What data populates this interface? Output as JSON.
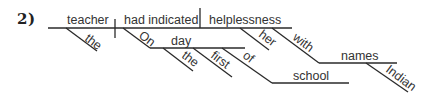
{
  "problem_number": "2)",
  "colors": {
    "line": "#2a2a2a",
    "text": "#333333",
    "background": "#ffffff"
  },
  "diagram": {
    "type": "sentence-diagram",
    "main_line": {
      "x1": 48,
      "y1": 28,
      "x2": 292,
      "y2": 28
    },
    "subject_divider": {
      "x1": 115,
      "y1": 19,
      "x2": 115,
      "y2": 38
    },
    "object_divider": {
      "x1": 200,
      "y1": 8,
      "x2": 200,
      "y2": 28
    },
    "words": {
      "subject": {
        "text": "teacher",
        "x": 67,
        "y": 24
      },
      "verb": {
        "text": "had indicated",
        "x": 124,
        "y": 24
      },
      "object": {
        "text": "helplessness",
        "x": 209,
        "y": 24
      },
      "the_1": {
        "text": "the",
        "x": 84,
        "y": 40,
        "angle": 37
      },
      "on": {
        "text": "On",
        "x": 138,
        "y": 37,
        "angle": 37
      },
      "day": {
        "text": "day",
        "x": 171,
        "y": 45
      },
      "the_2": {
        "text": "the",
        "x": 181,
        "y": 57,
        "angle": 37
      },
      "first": {
        "text": "first",
        "x": 210,
        "y": 57,
        "angle": 37
      },
      "of": {
        "text": "of",
        "x": 242,
        "y": 57,
        "angle": 37
      },
      "school": {
        "text": "school",
        "x": 293,
        "y": 80
      },
      "her": {
        "text": "her",
        "x": 258,
        "y": 36,
        "angle": 37
      },
      "with": {
        "text": "with",
        "x": 292,
        "y": 39,
        "angle": 37
      },
      "names": {
        "text": "names",
        "x": 341,
        "y": 60
      },
      "indian": {
        "text": "Indian",
        "x": 385,
        "y": 71,
        "angle": 37
      }
    },
    "segments": {
      "the_1_slant": {
        "x1": 66,
        "y1": 28,
        "x2": 97,
        "y2": 51
      },
      "on_slant": {
        "x1": 123,
        "y1": 28,
        "x2": 150,
        "y2": 48
      },
      "day_line": {
        "x1": 150,
        "y1": 48,
        "x2": 245,
        "y2": 48
      },
      "the_2_slant": {
        "x1": 163,
        "y1": 48,
        "x2": 193,
        "y2": 71
      },
      "first_slant": {
        "x1": 193,
        "y1": 48,
        "x2": 232,
        "y2": 77
      },
      "of_slant": {
        "x1": 222,
        "y1": 48,
        "x2": 272,
        "y2": 83
      },
      "school_line": {
        "x1": 272,
        "y1": 83,
        "x2": 349,
        "y2": 83
      },
      "her_slant": {
        "x1": 240,
        "y1": 28,
        "x2": 269,
        "y2": 50
      },
      "with_slant": {
        "x1": 272,
        "y1": 28,
        "x2": 319,
        "y2": 63
      },
      "names_line": {
        "x1": 319,
        "y1": 63,
        "x2": 397,
        "y2": 63
      },
      "indian_slant": {
        "x1": 366,
        "y1": 63,
        "x2": 408,
        "y2": 92
      }
    }
  }
}
